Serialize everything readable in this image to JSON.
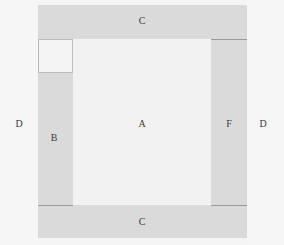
{
  "diagram": {
    "type": "layout-region-diagram",
    "colors": {
      "background": "#f6f6f6",
      "band": "#dadada",
      "center": "#f2f2f2",
      "divider": "#9a9a9a",
      "corner_box": "#f4f4f4",
      "text": "#3a3a3a"
    },
    "regions": [
      {
        "id": "D-left",
        "label": "D"
      },
      {
        "id": "C-top",
        "label": "C"
      },
      {
        "id": "corner",
        "label": ""
      },
      {
        "id": "B",
        "label": "B"
      },
      {
        "id": "A",
        "label": "A"
      },
      {
        "id": "F",
        "label": "F"
      },
      {
        "id": "C-bottom",
        "label": "C"
      },
      {
        "id": "D-right",
        "label": "D"
      }
    ]
  }
}
